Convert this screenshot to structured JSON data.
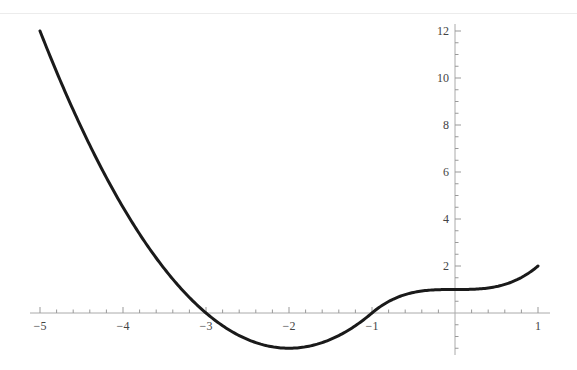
{
  "chart_data": {
    "type": "line",
    "title": "",
    "xlabel": "",
    "ylabel": "",
    "xlim": [
      -5,
      1
    ],
    "ylim": [
      -1.7,
      12.3
    ],
    "grid": false,
    "legend": null,
    "x_ticks": [
      -5,
      -4,
      -3,
      -2,
      -1,
      1
    ],
    "x_tick_labels": [
      "−5",
      "−4",
      "−3",
      "−2",
      "−1",
      "1"
    ],
    "y_ticks": [
      2,
      4,
      6,
      8,
      10,
      12
    ],
    "y_tick_labels": [
      "2",
      "4",
      "6",
      "8",
      "10",
      "12"
    ],
    "series": [
      {
        "name": "f(x)",
        "description": "piecewise: 1.5(x+1)(x+3) for x <= -1; x^3 + 1 for x > -1",
        "x": [
          -5,
          -4.5,
          -4,
          -3.5,
          -3,
          -2.5,
          -2,
          -1.5,
          -1,
          -0.5,
          0,
          0.5,
          1
        ],
        "y": [
          12,
          7.875,
          4.5,
          1.875,
          0,
          -1.125,
          -1.5,
          -1.125,
          0,
          0.875,
          1,
          1.125,
          2
        ]
      }
    ],
    "color": "#1a1a1a"
  }
}
